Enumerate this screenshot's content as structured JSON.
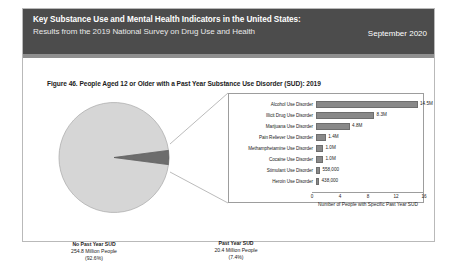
{
  "header": {
    "title": "Key Substance Use and Mental Health Indicators in the United States:",
    "subtitle": "Results from the 2019 National Survey on Drug Use and Health",
    "date": "September 2020",
    "band_color": "#4c4c4c"
  },
  "figure": {
    "title": "Figure 46. People Aged 12 or Older with a Past Year Substance Use Disorder (SUD): 2019"
  },
  "pie": {
    "no_sud": {
      "name": "No Past Year SUD",
      "people": "254.8 Million People",
      "percent": "(92.6%)"
    },
    "past_year_sud": {
      "name": "Past Year SUD",
      "people": "20.4 Million People",
      "percent": "(7.4%)"
    }
  },
  "chart_data": {
    "type": "bar",
    "orientation": "horizontal",
    "title": "Figure 46. People Aged 12 or Older with a Past Year Substance Use Disorder (SUD): 2019",
    "xlabel": "Number of People with Specific Past Year SUD",
    "ylabel": "",
    "xlim": [
      0,
      16
    ],
    "xticks": [
      "0",
      "4",
      "8",
      "12",
      "16"
    ],
    "grid": false,
    "legend": "none",
    "bar_color": "#898989",
    "categories": [
      "Alcohol Use Disorder",
      "Illicit Drug Use Disorder",
      "Marijuana Use Disorder",
      "Pain Reliever Use Disorder",
      "Methamphetamine Use Disorder",
      "Cocaine Use Disorder",
      "Stimulant Use Disorder",
      "Heroin Use Disorder"
    ],
    "values": [
      14.5,
      8.3,
      4.8,
      1.4,
      1.0,
      1.0,
      0.558,
      0.438
    ],
    "value_labels": [
      "14.5M",
      "8.3M",
      "4.8M",
      "1.4M",
      "1.0M",
      "1.0M",
      "558,000",
      "438,000"
    ],
    "pie": {
      "type": "pie",
      "slices": [
        {
          "label": "No Past Year SUD",
          "value": 92.6,
          "people": "254.8 Million People",
          "color": "#d4d4d4"
        },
        {
          "label": "Past Year SUD",
          "value": 7.4,
          "people": "20.4 Million People",
          "color": "#6d6d6d"
        }
      ]
    }
  }
}
